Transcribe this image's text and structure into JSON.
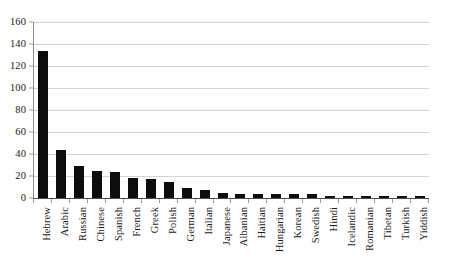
{
  "chart_data": {
    "type": "bar",
    "title": "",
    "subtitle": "",
    "xlabel": "",
    "ylabel": "",
    "ylim": [
      0,
      160
    ],
    "yticks": [
      0,
      20,
      40,
      60,
      80,
      100,
      120,
      140,
      160
    ],
    "grid": true,
    "legend": false,
    "orientation": "vertical",
    "bar_color": "#0d0d0d",
    "categories": [
      "Hebrew",
      "Arabic",
      "Russian",
      "Chinese",
      "Spanish",
      "French",
      "Greek",
      "Polish",
      "German",
      "Italian",
      "Japanese",
      "Albanian",
      "Haitian",
      "Hungarian",
      "Korean",
      "Swedish",
      "Hindi",
      "Icelandic",
      "Romanian",
      "Tibetan",
      "Turkish",
      "Yiddish"
    ],
    "values": [
      134,
      44,
      29,
      25,
      24,
      18,
      17,
      15,
      9,
      7,
      5,
      4,
      4,
      4,
      4,
      4,
      2,
      2,
      2,
      2,
      2,
      2
    ]
  },
  "colors": {
    "bar": "#0d0d0d",
    "gridline": "#d4d4d4",
    "axis": "#8c8c8c",
    "text": "#1a1a1a",
    "background": "#ffffff"
  }
}
